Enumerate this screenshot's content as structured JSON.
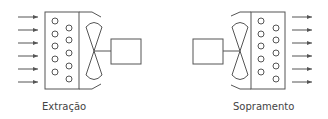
{
  "diagram": {
    "units": [
      {
        "id": "left",
        "label": "Extração"
      },
      {
        "id": "right",
        "label": "Sopramento"
      }
    ],
    "stroke_color": "#555555"
  }
}
